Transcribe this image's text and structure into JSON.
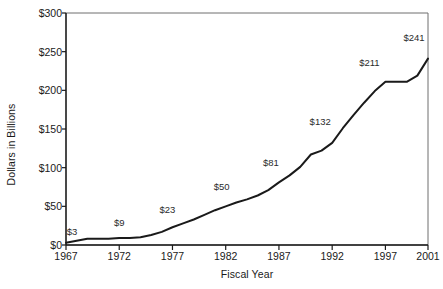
{
  "chart_data": {
    "type": "line",
    "title": "",
    "xlabel": "Fiscal Year",
    "ylabel": "Dollars in Billions",
    "xlim": [
      1967,
      2001
    ],
    "ylim": [
      0,
      300
    ],
    "xticks": [
      "1967",
      "1972",
      "1977",
      "1982",
      "1987",
      "1992",
      "1997",
      "2001"
    ],
    "xtick_values": [
      1967,
      1972,
      1977,
      1982,
      1987,
      1992,
      1997,
      2001
    ],
    "yticks": [
      "$0",
      "$50",
      "$100",
      "$150",
      "$200",
      "$250",
      "$300"
    ],
    "ytick_values": [
      0,
      50,
      100,
      150,
      200,
      250,
      300
    ],
    "grid": false,
    "legend": null,
    "line_color": "#1a1a1a",
    "series": [
      {
        "name": "Dollars in Billions",
        "x": [
          1967,
          1969,
          1971,
          1972,
          1973,
          1974,
          1975,
          1976,
          1977,
          1978,
          1979,
          1980,
          1981,
          1982,
          1983,
          1984,
          1985,
          1986,
          1987,
          1988,
          1989,
          1990,
          1991,
          1992,
          1993,
          1994,
          1995,
          1996,
          1997,
          1998,
          1999,
          2000,
          2001
        ],
        "values": [
          3,
          8,
          8,
          9,
          9,
          10,
          13,
          17,
          23,
          28,
          33,
          39,
          45,
          50,
          55,
          59,
          64,
          71,
          81,
          90,
          101,
          117,
          122,
          132,
          151,
          168,
          184,
          199,
          211,
          211,
          211,
          219,
          241
        ]
      }
    ],
    "point_labels": [
      {
        "text": "$3",
        "year": 1967,
        "value": 3
      },
      {
        "text": "$9",
        "year": 1972,
        "value": 9
      },
      {
        "text": "$23",
        "year": 1977,
        "value": 23
      },
      {
        "text": "$50",
        "year": 1982,
        "value": 50
      },
      {
        "text": "$81",
        "year": 1987,
        "value": 81
      },
      {
        "text": "$132",
        "year": 1992,
        "value": 132
      },
      {
        "text": "$211",
        "year": 1997,
        "value": 211
      },
      {
        "text": "$241",
        "year": 2001,
        "value": 241
      }
    ]
  }
}
